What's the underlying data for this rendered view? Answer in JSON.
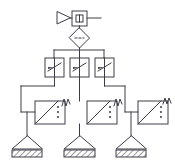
{
  "diagram": {
    "type": "pneumatic-circuit-schematic",
    "background_color": "#ffffff",
    "line_color": "#3c3c46",
    "line_width": 1,
    "width": 175,
    "height": 164
  },
  "components": {
    "air_supply": {
      "name": "compressed-air-supply",
      "symbol": "open-triangle-right",
      "x": 57,
      "y": 12,
      "width": 13,
      "height": 12
    },
    "conditioning_unit": {
      "name": "air-service-unit",
      "symbol": "square-with-inner-square",
      "x": 72,
      "y": 11,
      "width": 15,
      "height": 15
    },
    "supply_outlet": {
      "name": "supply-outlet-line",
      "x1": 87,
      "y1": 18,
      "x2": 101,
      "y2": 18
    },
    "filter": {
      "name": "filter-separator",
      "symbol": "diamond",
      "cx": 79,
      "cy": 38,
      "half": 10
    },
    "throttle_valves": [
      {
        "name": "throttle-valve-1",
        "x": 45,
        "y": 58,
        "width": 19,
        "height": 19,
        "symbol": "adjustable-restrictor"
      },
      {
        "name": "throttle-valve-2",
        "x": 70,
        "y": 58,
        "width": 19,
        "height": 19,
        "symbol": "adjustable-restrictor"
      },
      {
        "name": "throttle-valve-3",
        "x": 95,
        "y": 58,
        "width": 19,
        "height": 19,
        "symbol": "adjustable-restrictor"
      }
    ],
    "vibrators": [
      {
        "name": "vibrator-unit-1",
        "x": 35,
        "y": 101,
        "width": 30,
        "height": 23,
        "symbol": "turbine-vibrator-with-spring"
      },
      {
        "name": "vibrator-unit-2",
        "x": 87,
        "y": 101,
        "width": 30,
        "height": 23,
        "symbol": "turbine-vibrator-with-spring"
      },
      {
        "name": "vibrator-unit-3",
        "x": 138,
        "y": 101,
        "width": 30,
        "height": 23,
        "symbol": "turbine-vibrator-with-spring"
      }
    ],
    "hoppers": [
      {
        "name": "hopper-base-1",
        "cx": 27,
        "apex_y": 136,
        "base_y": 149,
        "half_width": 15,
        "bar_height": 7
      },
      {
        "name": "hopper-base-2",
        "cx": 79,
        "apex_y": 136,
        "base_y": 149,
        "half_width": 15,
        "bar_height": 7
      },
      {
        "name": "hopper-base-3",
        "cx": 131,
        "apex_y": 136,
        "base_y": 149,
        "half_width": 15,
        "bar_height": 7
      }
    ]
  },
  "connections": {
    "supply_to_unit": "air-supply to air-service-unit",
    "unit_to_filter": "air-service-unit down to filter",
    "filter_to_header": "filter down to distribution header",
    "header_span": {
      "x1": 54,
      "x2": 104,
      "y": 50
    },
    "header_drops": [
      54,
      79,
      104
    ],
    "valve_to_vibrator": [
      "throttle-valve-1 down-left to vibrator-unit-1",
      "throttle-valve-2 down to vibrator-unit-2",
      "throttle-valve-3 down-right to vibrator-unit-3"
    ],
    "vibrator_to_hopper": [
      "vibrator-unit-1 down to hopper-base-1",
      "vibrator-unit-2 down to hopper-base-2",
      "vibrator-unit-3 down to hopper-base-3"
    ]
  }
}
